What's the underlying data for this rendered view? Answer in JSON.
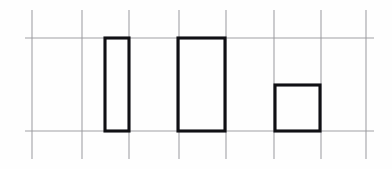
{
  "figure": {
    "background_color": "#fefefe",
    "grid_color": "#9a9a9e",
    "bar_stroke_color": "#101014",
    "width": 392,
    "height": 169
  },
  "chart_data": {
    "type": "bar",
    "title": "",
    "subtitle": "",
    "xlabel": "",
    "ylabel": "",
    "categories": [
      "bar-1",
      "bar-2",
      "bar-3"
    ],
    "values": [
      2,
      2,
      1
    ],
    "value_unit": "grid cells",
    "baseline_value": 0,
    "ylim": [
      0,
      2
    ],
    "xlim": [
      0,
      7
    ],
    "grid": true,
    "legend": false,
    "legend_position": "none",
    "annotations": [],
    "bars": [
      {
        "name": "bar-1",
        "value": 2,
        "x_left_px": 105,
        "x_right_px": 129,
        "y_top_px": 38,
        "y_bottom_px": 131,
        "width_px": 24,
        "height_px": 93
      },
      {
        "name": "bar-2",
        "value": 2,
        "x_left_px": 178,
        "x_right_px": 225,
        "y_top_px": 38,
        "y_bottom_px": 131,
        "width_px": 47,
        "height_px": 93
      },
      {
        "name": "bar-3",
        "value": 1,
        "x_left_px": 275,
        "x_right_px": 320,
        "y_top_px": 85,
        "y_bottom_px": 131,
        "width_px": 45,
        "height_px": 46
      }
    ],
    "grid_lines": {
      "vertical_x": [
        32,
        82,
        129,
        179,
        226,
        274,
        321,
        366
      ],
      "vertical_y_start": 10,
      "vertical_y_end": 159,
      "horizontal_y": [
        38,
        131
      ],
      "horizontal_x_start": 25,
      "horizontal_x_end": 374
    }
  }
}
